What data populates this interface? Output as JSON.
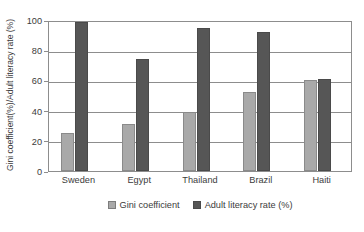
{
  "chart_data": {
    "type": "bar",
    "title": "",
    "subtitle": "",
    "xlabel": "",
    "ylabel": "Gini coefficient(%)/Adult literacy rate (%)",
    "categories": [
      "Sweden",
      "Egypt",
      "Thailand",
      "Brazil",
      "Haiti"
    ],
    "series": [
      {
        "name": "Gini coefficient",
        "color": "#a9a9a9",
        "values": [
          25,
          31,
          39,
          52,
          60
        ]
      },
      {
        "name": "Adult literacy rate (%)",
        "color": "#565656",
        "values": [
          99,
          74,
          95,
          92,
          61
        ]
      }
    ],
    "ylim": [
      0,
      100
    ],
    "ytick_labels": [
      "100",
      "80",
      "60",
      "40",
      "20",
      "0"
    ],
    "ytick_values": [
      100,
      80,
      60,
      40,
      20,
      0
    ],
    "grid": true,
    "grid_axis": "y",
    "legend_position": "bottom",
    "plot_background": "#ffffff",
    "axis_color": "#8d8d8d",
    "text_color": "#3b3b3b"
  },
  "legend": {
    "entries": [
      {
        "label": "Gini coefficient"
      },
      {
        "label": "Adult literacy rate (%)"
      }
    ]
  }
}
